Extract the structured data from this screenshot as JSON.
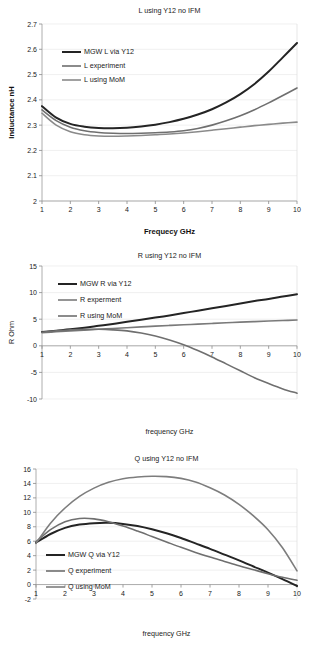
{
  "page": {
    "background": "#ffffff",
    "figure_count": 3
  },
  "palette": {
    "series_dark": "#242424",
    "series_mid": "#6f6f6f",
    "series_light": "#8f8f8f",
    "grid": "#e9e9e9",
    "axis": "#9b9b9b",
    "text": "#1a1a1a"
  },
  "chart_data": [
    {
      "id": "chart-inductance",
      "type": "line",
      "title": "L  using Y12 no IFM",
      "xlabel": "Frequecy GHz",
      "ylabel": "Inductance nH",
      "xlim": [
        1,
        10
      ],
      "ylim": [
        2,
        2.7
      ],
      "xticks": [
        1,
        2,
        3,
        4,
        5,
        6,
        7,
        8,
        9,
        10
      ],
      "yticks": [
        2,
        2.1,
        2.2,
        2.3,
        2.4,
        2.5,
        2.6,
        2.7
      ],
      "ytick_labels": [
        "2",
        "2.1",
        "2.2",
        "2.3",
        "2.4",
        "2.5",
        "2.6",
        "2.7"
      ],
      "grid": true,
      "legend_position": "upper-left-inside",
      "x": [
        1,
        1.5,
        2,
        2.5,
        3,
        3.5,
        4,
        4.5,
        5,
        5.5,
        6,
        6.5,
        7,
        7.5,
        8,
        8.5,
        9,
        9.5,
        10
      ],
      "series": [
        {
          "name": "MGW L via Y12",
          "color": "#242424",
          "width": 2.0,
          "values": [
            2.375,
            2.33,
            2.305,
            2.294,
            2.289,
            2.288,
            2.29,
            2.295,
            2.302,
            2.312,
            2.325,
            2.342,
            2.363,
            2.39,
            2.423,
            2.463,
            2.512,
            2.568,
            2.625
          ]
        },
        {
          "name": "L experiment",
          "color": "#6f6f6f",
          "width": 1.6,
          "values": [
            2.36,
            2.318,
            2.292,
            2.278,
            2.271,
            2.268,
            2.267,
            2.268,
            2.27,
            2.273,
            2.278,
            2.287,
            2.3,
            2.317,
            2.337,
            2.361,
            2.388,
            2.417,
            2.447
          ]
        },
        {
          "name": "L using MoM",
          "color": "#8a8a8a",
          "width": 1.6,
          "values": [
            2.347,
            2.3,
            2.274,
            2.262,
            2.257,
            2.256,
            2.257,
            2.259,
            2.262,
            2.265,
            2.269,
            2.274,
            2.28,
            2.286,
            2.292,
            2.298,
            2.303,
            2.308,
            2.312
          ]
        }
      ]
    },
    {
      "id": "chart-resistance",
      "type": "line",
      "title": "R using Y12 no IFM",
      "xlabel": "frequency GHz",
      "ylabel": "R Ohm",
      "xlim": [
        1,
        10
      ],
      "ylim": [
        -10,
        15
      ],
      "xticks": [
        1,
        2,
        3,
        4,
        5,
        6,
        7,
        8,
        9,
        10
      ],
      "yticks": [
        -10,
        -5,
        0,
        5,
        10,
        15
      ],
      "ytick_labels": [
        "-10",
        "-5",
        "0",
        "5",
        "10",
        "15"
      ],
      "grid": true,
      "legend_position": "upper-left-inside",
      "x": [
        1,
        1.5,
        2,
        2.5,
        3,
        3.5,
        4,
        4.5,
        5,
        5.5,
        6,
        6.5,
        7,
        7.5,
        8,
        8.5,
        9,
        9.5,
        10
      ],
      "series": [
        {
          "name": "MGW R via Y12",
          "color": "#242424",
          "width": 2.0,
          "values": [
            2.6,
            2.85,
            3.1,
            3.4,
            3.75,
            4.1,
            4.5,
            4.9,
            5.3,
            5.7,
            6.15,
            6.6,
            7.05,
            7.5,
            7.95,
            8.4,
            8.8,
            9.25,
            9.7
          ]
        },
        {
          "name": "R experment",
          "color": "#7a7a7a",
          "width": 1.6,
          "values": [
            2.45,
            2.63,
            2.8,
            2.95,
            3.1,
            3.25,
            3.4,
            3.55,
            3.7,
            3.83,
            3.95,
            4.08,
            4.2,
            4.32,
            4.45,
            4.55,
            4.65,
            4.75,
            4.85
          ]
        },
        {
          "name": "R using MoM",
          "color": "#6f6f6f",
          "width": 1.6,
          "values": [
            2.55,
            2.8,
            3.0,
            3.08,
            3.1,
            3.0,
            2.8,
            2.4,
            1.85,
            1.1,
            0.2,
            -0.9,
            -2.1,
            -3.4,
            -4.7,
            -6.0,
            -7.1,
            -8.1,
            -8.9
          ]
        }
      ]
    },
    {
      "id": "chart-q",
      "type": "line",
      "title": "Q using Y12 no IFM",
      "xlabel": "frequency GHz",
      "ylabel": "",
      "xlim": [
        1,
        10
      ],
      "ylim": [
        -2,
        16
      ],
      "xticks": [
        1,
        2,
        3,
        4,
        5,
        6,
        7,
        8,
        9,
        10
      ],
      "yticks": [
        -2,
        0,
        2,
        4,
        6,
        8,
        10,
        12,
        14,
        16
      ],
      "ytick_labels": [
        "-2",
        "0",
        "2",
        "4",
        "6",
        "8",
        "10",
        "12",
        "14",
        "16"
      ],
      "grid": true,
      "legend_position": "lower-left-inside",
      "x": [
        1,
        1.5,
        2,
        2.5,
        3,
        3.5,
        4,
        4.5,
        5,
        5.5,
        6,
        6.5,
        7,
        7.5,
        8,
        8.5,
        9,
        9.5,
        10
      ],
      "series": [
        {
          "name": "MGW Q via Y12",
          "color": "#242424",
          "width": 2.0,
          "values": [
            5.8,
            7.0,
            7.85,
            8.3,
            8.5,
            8.55,
            8.4,
            8.1,
            7.65,
            7.1,
            6.45,
            5.7,
            4.95,
            4.15,
            3.35,
            2.5,
            1.65,
            0.75,
            -0.2
          ]
        },
        {
          "name": "Q experiment",
          "color": "#6f6f6f",
          "width": 1.6,
          "values": [
            5.9,
            7.6,
            8.7,
            9.15,
            9.1,
            8.7,
            8.1,
            7.4,
            6.65,
            5.9,
            5.15,
            4.45,
            3.8,
            3.2,
            2.6,
            2.05,
            1.5,
            1.0,
            0.6
          ]
        },
        {
          "name": "Q using MoM",
          "color": "#7d7d7d",
          "width": 1.6,
          "values": [
            5.7,
            8.5,
            10.6,
            12.2,
            13.35,
            14.15,
            14.65,
            14.9,
            15.0,
            14.95,
            14.7,
            14.2,
            13.4,
            12.4,
            11.1,
            9.5,
            7.6,
            5.1,
            1.9
          ]
        }
      ]
    }
  ]
}
